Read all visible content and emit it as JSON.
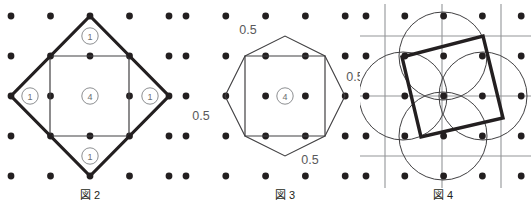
{
  "document": {
    "title": "幾何図形 図2・図3・図4",
    "background_color": "#ffffff",
    "ink_color": "#231f20",
    "grid_line_color": "#939598",
    "label_color": "#58595b"
  },
  "figures": [
    {
      "id": "fig2",
      "caption": "図 2",
      "description": "点格子上に描かれた正方形とその外接する傾いた正方形（ひし形）",
      "grid": {
        "columns": 5,
        "rows": 5,
        "dot_radius": 3.4,
        "spacing_x": 39.5,
        "spacing_y": 40,
        "origin_x": 11,
        "origin_y": 16
      },
      "inner_square": {
        "stroke_color": "#414042",
        "stroke_width": 1.2,
        "corners": [
          [
            50,
            56
          ],
          [
            129,
            56
          ],
          [
            129,
            136
          ],
          [
            50,
            136
          ]
        ]
      },
      "outer_diamond": {
        "stroke_color": "#231f20",
        "stroke_width": 3.2,
        "corners": [
          [
            90,
            16
          ],
          [
            169,
            96
          ],
          [
            90,
            176
          ],
          [
            11,
            96
          ]
        ]
      },
      "labels": [
        {
          "text": "1",
          "circled": true,
          "x": 90,
          "y": 36,
          "name": "area-label-top"
        },
        {
          "text": "1",
          "circled": true,
          "x": 30,
          "y": 96,
          "name": "area-label-left"
        },
        {
          "text": "4",
          "circled": true,
          "x": 90,
          "y": 96,
          "name": "area-label-center"
        },
        {
          "text": "1",
          "circled": true,
          "x": 150,
          "y": 96,
          "name": "area-label-right"
        },
        {
          "text": "1",
          "circled": true,
          "x": 90,
          "y": 156,
          "name": "area-label-bottom"
        }
      ],
      "caption_x": 90,
      "caption_y": 199
    },
    {
      "id": "fig3",
      "caption": "図 3",
      "description": "点格子上の正方形と、各辺に高さ0.5の三角形を付けた星形多角形",
      "grid": {
        "columns": 6,
        "rows": 5,
        "dot_radius": 3.4,
        "spacing_x": 39.8,
        "spacing_y": 40,
        "origin_x": 6,
        "origin_y": 16
      },
      "inner_square": {
        "stroke_color": "#414042",
        "stroke_width": 1.2,
        "corners": [
          [
            65,
            56
          ],
          [
            145,
            56
          ],
          [
            145,
            136
          ],
          [
            65,
            136
          ]
        ]
      },
      "star_polygon": {
        "stroke_color": "#414042",
        "stroke_width": 1.1,
        "points": [
          [
            65,
            56
          ],
          [
            105,
            36
          ],
          [
            145,
            56
          ],
          [
            165,
            96
          ],
          [
            145,
            136
          ],
          [
            105,
            156
          ],
          [
            65,
            136
          ],
          [
            45,
            96
          ]
        ]
      },
      "labels": [
        {
          "text": "0.5",
          "circled": false,
          "x": 68,
          "y": 34,
          "name": "length-label-top"
        },
        {
          "text": "0.5",
          "circled": false,
          "x": 21,
          "y": 120,
          "name": "length-label-left"
        },
        {
          "text": "4",
          "circled": true,
          "x": 105,
          "y": 96,
          "name": "area-label-center"
        },
        {
          "text": "0.5",
          "circled": false,
          "x": 175,
          "y": 81,
          "name": "length-label-right"
        },
        {
          "text": "0.5",
          "circled": false,
          "x": 130,
          "y": 164,
          "name": "length-label-bottom"
        }
      ],
      "caption_x": 105,
      "caption_y": 199
    },
    {
      "id": "fig4",
      "caption": "図 4",
      "description": "点格子と細いグリッド線の上に、4つの円と太線の傾いた正方形",
      "grid": {
        "columns": 5,
        "rows": 5,
        "dot_radius": 3.4,
        "spacing_x": 38.8,
        "spacing_y": 40,
        "origin_x": 6,
        "origin_y": 16
      },
      "guide_lines": {
        "stroke_color": "#939598",
        "stroke_width": 1.1,
        "vertical_x": [
          25,
          82,
          141
        ],
        "horizontal_y": [
          36,
          96,
          156
        ]
      },
      "circles": {
        "stroke_color": "#414042",
        "stroke_width": 1.0,
        "radius": 44,
        "centers": [
          [
            83,
            56
          ],
          [
            83,
            136
          ],
          [
            43,
            96
          ],
          [
            123,
            96
          ]
        ]
      },
      "tilted_square": {
        "stroke_color": "#231f20",
        "stroke_width": 3.4,
        "corners": [
          [
            123,
            36
          ],
          [
            143,
            118
          ],
          [
            61,
            137
          ],
          [
            42,
            57
          ]
        ]
      },
      "labels": [],
      "caption_x": 83,
      "caption_y": 199
    }
  ]
}
